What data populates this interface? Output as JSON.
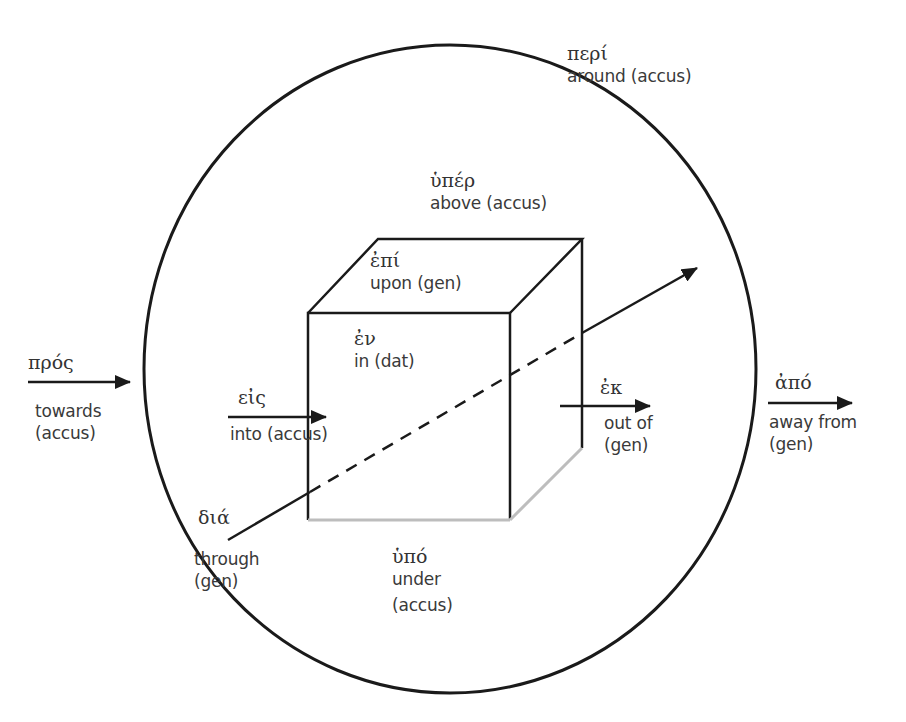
{
  "diagram": {
    "colors": {
      "stroke": "#1a1a1a",
      "light_edge": "#bdbdbd",
      "text": "#3a3a3a",
      "background": "#ffffff"
    },
    "shapes": {
      "circle": {
        "cx": 450,
        "cy": 369,
        "rx": 306,
        "ry": 324
      },
      "cube": {
        "front_face": {
          "x1": 308,
          "y1": 313,
          "x2": 510,
          "y2": 520
        },
        "back_top_left": [
          378,
          239
        ],
        "back_top_right": [
          582,
          239
        ],
        "back_bottom_right": [
          582,
          448
        ]
      }
    },
    "prepositions": [
      {
        "id": "peri",
        "greek": "περί",
        "english": "around (accus)"
      },
      {
        "id": "hyper",
        "greek": "ὑπέρ",
        "english": "above (accus)"
      },
      {
        "id": "epi",
        "greek": "ἐπί",
        "english": "upon (gen)"
      },
      {
        "id": "en",
        "greek": "ἐν",
        "english": "in (dat)"
      },
      {
        "id": "pros",
        "greek": "πρός",
        "english": "towards",
        "case": "(accus)"
      },
      {
        "id": "eis",
        "greek": "εἰς",
        "english": "into (accus)"
      },
      {
        "id": "ek",
        "greek": "ἐκ",
        "english": "out of",
        "case": "(gen)"
      },
      {
        "id": "apo",
        "greek": "ἀπό",
        "english": "away from",
        "case": "(gen)"
      },
      {
        "id": "dia",
        "greek": "διά",
        "english": "through",
        "case": "(gen)"
      },
      {
        "id": "hypo",
        "greek": "ὑπό",
        "english": "under",
        "case": "(accus)"
      }
    ],
    "arrows": [
      {
        "id": "pros-arrow",
        "from": [
          28,
          382
        ],
        "to": [
          130,
          382
        ]
      },
      {
        "id": "eis-arrow",
        "from": [
          228,
          417
        ],
        "to": [
          326,
          417
        ]
      },
      {
        "id": "ek-arrow",
        "from": [
          560,
          406
        ],
        "to": [
          650,
          406
        ]
      },
      {
        "id": "apo-arrow",
        "from": [
          768,
          403
        ],
        "to": [
          852,
          403
        ]
      },
      {
        "id": "dia-arrow",
        "from": [
          228,
          540
        ],
        "to": [
          697,
          268
        ],
        "dashed_inside_cube": true
      }
    ]
  }
}
